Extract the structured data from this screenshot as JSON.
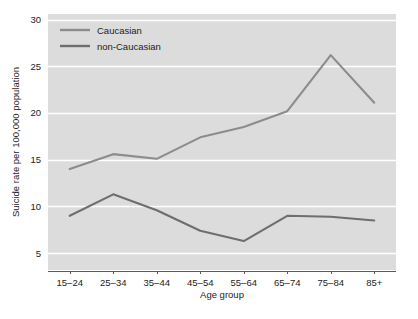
{
  "chart_data": {
    "type": "line",
    "title": "",
    "xlabel": "Age group",
    "ylabel": "Suicide rate per 100,000 population",
    "categories": [
      "15–24",
      "25–34",
      "35–44",
      "45–54",
      "55–64",
      "65–74",
      "75–84",
      "85+"
    ],
    "series": [
      {
        "name": "Caucasian",
        "color": "#8c8c8c",
        "values": [
          14.0,
          15.6,
          15.1,
          17.4,
          18.5,
          20.2,
          26.2,
          21.1
        ]
      },
      {
        "name": "non-Caucasian",
        "color": "#6e6e6e",
        "values": [
          9.0,
          11.3,
          9.6,
          7.4,
          6.3,
          9.0,
          8.9,
          8.5
        ]
      }
    ],
    "ylim": [
      3.2,
      30.6
    ],
    "yticks": [
      5,
      10,
      15,
      20,
      25,
      30
    ],
    "ytick_labels": [
      "5",
      "10",
      "15",
      "20",
      "25",
      "30"
    ],
    "grid": "horizontal-white",
    "plot_background": "#dcdcdc",
    "figure_background": "#ffffff",
    "legend_position": "top-left-inside"
  }
}
